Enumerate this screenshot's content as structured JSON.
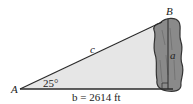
{
  "diagram": {
    "vertex_a_label": "A",
    "vertex_b_label": "B",
    "side_c_label": "c",
    "side_a_label": "a",
    "side_b_label": "b = 2614 ft",
    "angle_label": "25°",
    "colors": {
      "triangle_fill": "#e6e6e6",
      "line": "#2a2a2a",
      "rock_fill": "#8a8a8a",
      "rock_outline": "#333333"
    }
  }
}
